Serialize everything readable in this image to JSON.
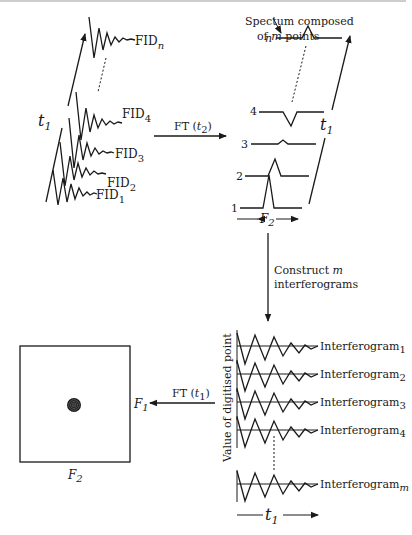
{
  "fid_stack": {
    "labels": [
      {
        "base": "FID",
        "sub": "1"
      },
      {
        "base": "FID",
        "sub": "2"
      },
      {
        "base": "FID",
        "sub": "3"
      },
      {
        "base": "FID",
        "sub": "4"
      },
      {
        "base": "FID",
        "sub": "n"
      }
    ],
    "axis_label": {
      "base": "t",
      "sub": "1"
    }
  },
  "ft_t2": {
    "label": "FT (",
    "var": "t",
    "sub": "2",
    "close": ")"
  },
  "spectra": {
    "annotation_line1": "Spectum composed",
    "annotation_line2_pre": "of ",
    "annotation_var": "m",
    "annotation_line2_post": " points",
    "row_labels": [
      "1",
      "2",
      "3",
      "4",
      "n"
    ],
    "axis_label": {
      "base": "t",
      "sub": "1"
    },
    "freq_label": {
      "base": "F",
      "sub": "2"
    }
  },
  "construct": {
    "line1_pre": "Construct ",
    "var": "m",
    "line2": "interferograms"
  },
  "interferograms": {
    "y_label": "Value of digitised point",
    "labels": [
      {
        "base": "Interferogram",
        "sub": "1"
      },
      {
        "base": "Interferogram",
        "sub": "2"
      },
      {
        "base": "Interferogram",
        "sub": "3"
      },
      {
        "base": "Interferogram",
        "sub": "4"
      },
      {
        "base": "Interferogram",
        "sub": "m"
      }
    ],
    "axis_label": {
      "base": "t",
      "sub": "1"
    }
  },
  "ft_t1": {
    "label": "FT (",
    "var": "t",
    "sub": "1",
    "close": ")"
  },
  "spectrum_2d": {
    "f1_label": {
      "base": "F",
      "sub": "1"
    },
    "f2_label": {
      "base": "F",
      "sub": "2"
    }
  }
}
